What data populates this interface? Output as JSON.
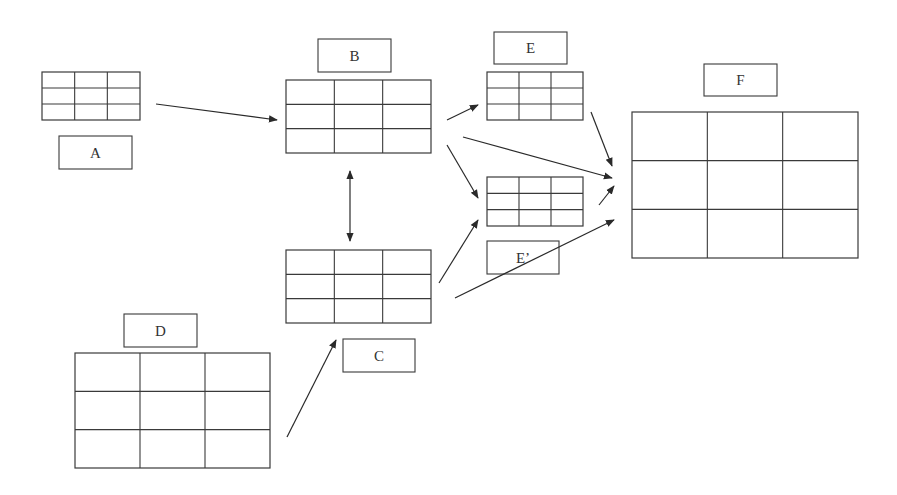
{
  "diagram": {
    "stroke": "#3a3a3a",
    "tables": [
      {
        "id": "A",
        "x": 42,
        "y": 72,
        "w": 98,
        "h": 48,
        "rows": 3,
        "cols": 3
      },
      {
        "id": "B",
        "x": 286,
        "y": 80,
        "w": 145,
        "h": 73,
        "rows": 3,
        "cols": 3
      },
      {
        "id": "C",
        "x": 286,
        "y": 250,
        "w": 145,
        "h": 73,
        "rows": 3,
        "cols": 3
      },
      {
        "id": "D",
        "x": 75,
        "y": 353,
        "w": 195,
        "h": 115,
        "rows": 3,
        "cols": 3
      },
      {
        "id": "E",
        "x": 487,
        "y": 72,
        "w": 96,
        "h": 48,
        "rows": 3,
        "cols": 3
      },
      {
        "id": "E2",
        "x": 487,
        "y": 177,
        "w": 96,
        "h": 49,
        "rows": 3,
        "cols": 3
      },
      {
        "id": "F",
        "x": 632,
        "y": 112,
        "w": 226,
        "h": 146,
        "rows": 3,
        "cols": 3
      }
    ],
    "labels": [
      {
        "id": "A",
        "text": "A",
        "x": 59,
        "y": 136,
        "w": 73,
        "h": 33
      },
      {
        "id": "B",
        "text": "B",
        "x": 318,
        "y": 39,
        "w": 73,
        "h": 33
      },
      {
        "id": "C",
        "text": "C",
        "x": 343,
        "y": 339,
        "w": 72,
        "h": 33
      },
      {
        "id": "D",
        "text": "D",
        "x": 124,
        "y": 314,
        "w": 73,
        "h": 33
      },
      {
        "id": "E",
        "text": "E",
        "x": 494,
        "y": 32,
        "w": 73,
        "h": 32
      },
      {
        "id": "E2",
        "text": "E’",
        "x": 487,
        "y": 241,
        "w": 72,
        "h": 33
      },
      {
        "id": "F",
        "text": "F",
        "x": 704,
        "y": 64,
        "w": 73,
        "h": 32
      }
    ],
    "arrows": [
      {
        "from": "A",
        "to": "B",
        "x1": 156,
        "y1": 104,
        "x2": 277,
        "y2": 120,
        "both": false
      },
      {
        "from": "B",
        "to": "C",
        "x1": 350,
        "y1": 171,
        "x2": 350,
        "y2": 241,
        "both": true
      },
      {
        "from": "B",
        "to": "E",
        "x1": 447,
        "y1": 120,
        "x2": 478,
        "y2": 105,
        "both": false
      },
      {
        "from": "B",
        "to": "F",
        "x1": 463,
        "y1": 137,
        "x2": 612,
        "y2": 178,
        "both": false
      },
      {
        "from": "B",
        "to": "E2",
        "x1": 447,
        "y1": 145,
        "x2": 478,
        "y2": 198,
        "both": false
      },
      {
        "from": "E",
        "to": "F",
        "x1": 591,
        "y1": 112,
        "x2": 612,
        "y2": 166,
        "both": false
      },
      {
        "from": "E2",
        "to": "F",
        "x1": 599,
        "y1": 205,
        "x2": 614,
        "y2": 186,
        "both": false
      },
      {
        "from": "C",
        "to": "E2",
        "x1": 439,
        "y1": 283,
        "x2": 478,
        "y2": 220,
        "both": false
      },
      {
        "from": "C",
        "to": "F",
        "x1": 455,
        "y1": 298,
        "x2": 614,
        "y2": 220,
        "both": false
      },
      {
        "from": "D",
        "to": "C",
        "x1": 287,
        "y1": 437,
        "x2": 336,
        "y2": 340,
        "both": false
      }
    ]
  }
}
